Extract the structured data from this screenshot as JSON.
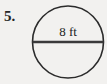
{
  "figure": {
    "problem_number": "5.",
    "shape": "circle",
    "dimension_label": "8 ft",
    "measure_type": "diameter",
    "value": 8,
    "unit": "ft",
    "colors": {
      "background": "#f2f1ef",
      "outline": "#2b2b2b",
      "chord": "#3a3a3a",
      "text": "#232323"
    },
    "geometry": {
      "center_x": 68,
      "center_y": 42,
      "radius_x": 35.5,
      "radius_y": 36,
      "chord_y": 42,
      "chord_x_start": 32.5,
      "chord_x_end": 103.5
    }
  }
}
